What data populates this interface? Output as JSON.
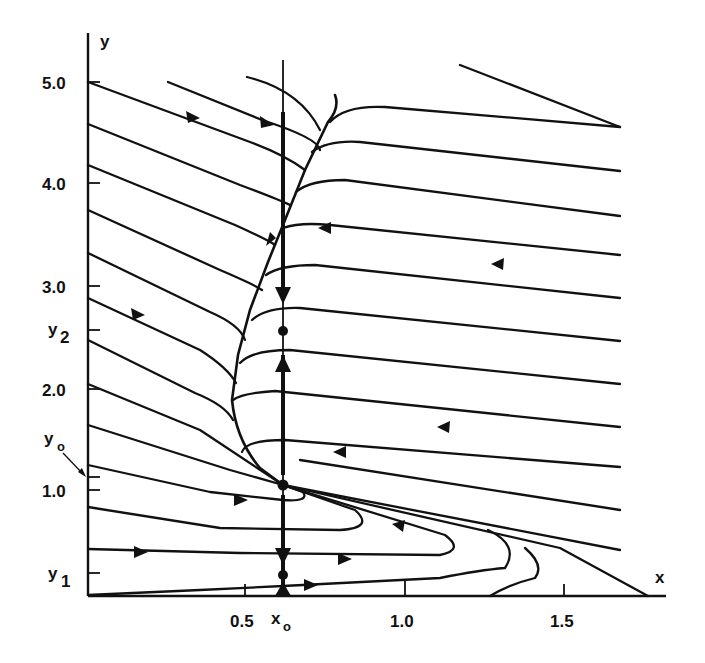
{
  "diagram": {
    "type": "phase-portrait",
    "axes": {
      "x_label": "x",
      "y_label": "y",
      "x_ticks": [
        {
          "label": "0.5",
          "value": 0.5
        },
        {
          "label": "1.0",
          "value": 1.0
        },
        {
          "label": "1.5",
          "value": 1.5
        }
      ],
      "y_ticks": [
        {
          "label": "5.0",
          "value": 5.0
        },
        {
          "label": "4.0",
          "value": 4.0
        },
        {
          "label": "3.0",
          "value": 3.0
        },
        {
          "label": "2.0",
          "value": 2.0
        },
        {
          "label": "1.0",
          "value": 1.0
        }
      ],
      "special_x": {
        "base": "x",
        "sub": "o"
      },
      "special_y": [
        {
          "base": "y",
          "sub": "2"
        },
        {
          "base": "y",
          "sub": "o"
        },
        {
          "base": "y",
          "sub": "1"
        }
      ]
    },
    "equilibria": [
      {
        "name": "upper-point",
        "at": "(x_o, y_2)"
      },
      {
        "name": "saddle-point",
        "at": "(x_o, y_o)"
      },
      {
        "name": "lower-point",
        "at": "(x_o, y_1)"
      }
    ]
  }
}
